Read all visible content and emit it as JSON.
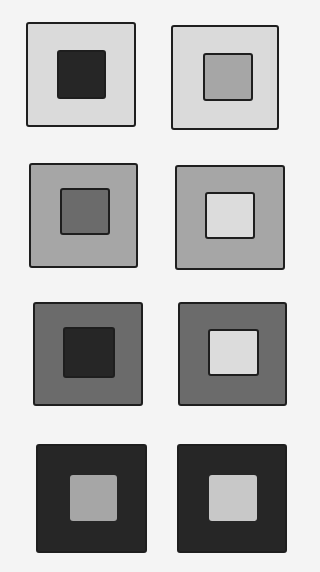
{
  "figure": {
    "colors": {
      "light": "#dadada",
      "mid": "#a6a6a6",
      "dark": "#6b6b6b",
      "black": "#262626",
      "inner_mid": "#a6a6a6",
      "inner_light": "#dcdcdc"
    },
    "squares": [
      {
        "id": "r1c1",
        "x": 26,
        "y": 22,
        "w": 110,
        "h": 105,
        "outer": "#dadada",
        "inner": "#262626",
        "ix": 31,
        "iy": 28,
        "iw": 49,
        "ih": 49
      },
      {
        "id": "r1c2",
        "x": 171,
        "y": 25,
        "w": 108,
        "h": 105,
        "outer": "#dadada",
        "inner": "#a6a6a6",
        "ix": 32,
        "iy": 28,
        "iw": 50,
        "ih": 48
      },
      {
        "id": "r2c1",
        "x": 29,
        "y": 163,
        "w": 109,
        "h": 105,
        "outer": "#a6a6a6",
        "inner": "#6b6b6b",
        "ix": 31,
        "iy": 25,
        "iw": 50,
        "ih": 47
      },
      {
        "id": "r2c2",
        "x": 175,
        "y": 165,
        "w": 110,
        "h": 105,
        "outer": "#a6a6a6",
        "inner": "#dcdcdc",
        "ix": 30,
        "iy": 27,
        "iw": 50,
        "ih": 47
      },
      {
        "id": "r3c1",
        "x": 33,
        "y": 302,
        "w": 110,
        "h": 104,
        "outer": "#6b6b6b",
        "inner": "#262626",
        "ix": 30,
        "iy": 25,
        "iw": 52,
        "ih": 51
      },
      {
        "id": "r3c2",
        "x": 178,
        "y": 302,
        "w": 109,
        "h": 104,
        "outer": "#6b6b6b",
        "inner": "#dcdcdc",
        "ix": 30,
        "iy": 27,
        "iw": 51,
        "ih": 47
      },
      {
        "id": "r4c1",
        "x": 36,
        "y": 444,
        "w": 111,
        "h": 109,
        "outer": "#262626",
        "inner": "#a6a6a6",
        "ix": 34,
        "iy": 31,
        "iw": 47,
        "ih": 46
      },
      {
        "id": "r4c2",
        "x": 177,
        "y": 444,
        "w": 110,
        "h": 109,
        "outer": "#262626",
        "inner": "#c8c8c8",
        "ix": 32,
        "iy": 31,
        "iw": 48,
        "ih": 46
      }
    ]
  }
}
